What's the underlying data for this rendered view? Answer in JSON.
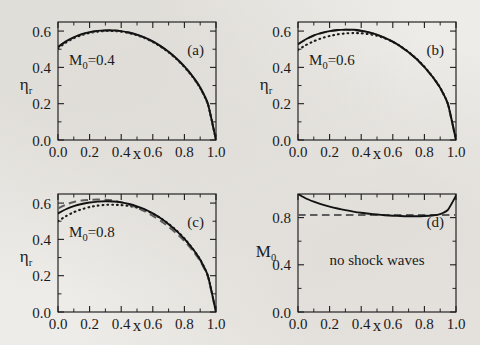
{
  "figure": {
    "background_color": "#eeece8",
    "ink_color": "#121212",
    "dashed_color": "#5d5d5d",
    "layout": "2x2 grid of plots"
  },
  "axis": {
    "x_label": "x",
    "x_ticks": [
      "0.0",
      "0.2",
      "0.4",
      "0.6",
      "0.8",
      "1.0"
    ],
    "x_tick_values": [
      0.0,
      0.2,
      0.4,
      0.6,
      0.8,
      1.0
    ],
    "x_minor_per_interval": 1,
    "eta_label_main": "η",
    "eta_label_sub": "r",
    "eta_ticks": [
      "0.0",
      "0.2",
      "0.4",
      "0.6"
    ],
    "eta_tick_values": [
      0.0,
      0.2,
      0.4,
      0.6
    ],
    "m0_label_main": "M",
    "m0_label_sub": "0",
    "m0_ticks": [
      "0.0",
      "0.4",
      "0.8"
    ],
    "m0_tick_values": [
      0.0,
      0.4,
      0.8
    ]
  },
  "panels": [
    {
      "tag": "(a)",
      "annotation_main": "M",
      "annotation_sub": "0",
      "annotation_rest": "=0.4",
      "y_label_kind": "eta"
    },
    {
      "tag": "(b)",
      "annotation_main": "M",
      "annotation_sub": "0",
      "annotation_rest": "=0.6",
      "y_label_kind": "eta"
    },
    {
      "tag": "(c)",
      "annotation_main": "M",
      "annotation_sub": "0",
      "annotation_rest": "=0.8",
      "y_label_kind": "eta"
    },
    {
      "tag": "(d)",
      "annotation_main": "no shock waves",
      "annotation_sub": "",
      "annotation_rest": "",
      "y_label_kind": "m0"
    }
  ],
  "chart_data": [
    {
      "type": "line",
      "panel": "(a)",
      "title": "",
      "annotation": "M0=0.4",
      "xlabel": "x",
      "ylabel": "η_r",
      "xlim": [
        0.0,
        1.0
      ],
      "ylim": [
        0.0,
        0.65
      ],
      "grid": false,
      "legend": "none",
      "x": [
        0.0,
        0.05,
        0.1,
        0.15,
        0.2,
        0.25,
        0.3,
        0.35,
        0.4,
        0.45,
        0.5,
        0.55,
        0.6,
        0.65,
        0.7,
        0.75,
        0.8,
        0.85,
        0.9,
        0.95,
        1.0
      ],
      "series": [
        {
          "name": "solid",
          "style": "solid",
          "values": [
            0.513,
            0.543,
            0.566,
            0.583,
            0.594,
            0.601,
            0.604,
            0.604,
            0.6,
            0.592,
            0.58,
            0.564,
            0.543,
            0.517,
            0.486,
            0.449,
            0.405,
            0.353,
            0.289,
            0.196,
            0.0
          ]
        },
        {
          "name": "dashed",
          "style": "dashed",
          "values": [
            0.512,
            0.542,
            0.565,
            0.582,
            0.593,
            0.6,
            0.603,
            0.603,
            0.599,
            0.591,
            0.579,
            0.563,
            0.542,
            0.516,
            0.485,
            0.448,
            0.404,
            0.352,
            0.288,
            0.195,
            0.0
          ]
        },
        {
          "name": "dotted",
          "style": "dotted",
          "values": [
            0.505,
            0.537,
            0.561,
            0.578,
            0.59,
            0.597,
            0.6,
            0.6,
            0.597,
            0.589,
            0.577,
            0.561,
            0.54,
            0.514,
            0.483,
            0.446,
            0.402,
            0.35,
            0.287,
            0.194,
            0.0
          ]
        }
      ]
    },
    {
      "type": "line",
      "panel": "(b)",
      "title": "",
      "annotation": "M0=0.6",
      "xlabel": "x",
      "ylabel": "η_r",
      "xlim": [
        0.0,
        1.0
      ],
      "ylim": [
        0.0,
        0.65
      ],
      "grid": false,
      "legend": "none",
      "x": [
        0.0,
        0.05,
        0.1,
        0.15,
        0.2,
        0.25,
        0.3,
        0.35,
        0.4,
        0.45,
        0.5,
        0.55,
        0.6,
        0.65,
        0.7,
        0.75,
        0.8,
        0.85,
        0.9,
        0.95,
        1.0
      ],
      "series": [
        {
          "name": "solid",
          "style": "solid",
          "values": [
            0.528,
            0.555,
            0.576,
            0.59,
            0.6,
            0.606,
            0.608,
            0.607,
            0.602,
            0.593,
            0.58,
            0.563,
            0.542,
            0.515,
            0.483,
            0.446,
            0.402,
            0.35,
            0.287,
            0.195,
            0.0
          ]
        },
        {
          "name": "dashed",
          "style": "dashed",
          "values": [
            0.527,
            0.554,
            0.575,
            0.589,
            0.599,
            0.605,
            0.607,
            0.606,
            0.601,
            0.592,
            0.579,
            0.562,
            0.541,
            0.514,
            0.482,
            0.445,
            0.401,
            0.349,
            0.286,
            0.194,
            0.0
          ]
        },
        {
          "name": "dotted",
          "style": "dotted",
          "values": [
            0.497,
            0.523,
            0.544,
            0.561,
            0.573,
            0.582,
            0.587,
            0.589,
            0.588,
            0.583,
            0.574,
            0.56,
            0.541,
            0.516,
            0.485,
            0.448,
            0.404,
            0.351,
            0.288,
            0.196,
            0.0
          ]
        }
      ]
    },
    {
      "type": "line",
      "panel": "(c)",
      "title": "",
      "annotation": "M0=0.8",
      "xlabel": "x",
      "ylabel": "η_r",
      "xlim": [
        0.0,
        1.0
      ],
      "ylim": [
        0.0,
        0.65
      ],
      "grid": false,
      "legend": "none",
      "x": [
        0.0,
        0.05,
        0.1,
        0.15,
        0.2,
        0.25,
        0.3,
        0.35,
        0.4,
        0.45,
        0.5,
        0.55,
        0.6,
        0.65,
        0.7,
        0.75,
        0.8,
        0.85,
        0.9,
        0.95,
        1.0
      ],
      "series": [
        {
          "name": "solid",
          "style": "solid",
          "values": [
            0.543,
            0.566,
            0.583,
            0.595,
            0.603,
            0.608,
            0.61,
            0.609,
            0.604,
            0.595,
            0.582,
            0.565,
            0.543,
            0.516,
            0.484,
            0.447,
            0.403,
            0.351,
            0.288,
            0.196,
            0.0
          ]
        },
        {
          "name": "dashed",
          "style": "dashed",
          "values": [
            0.57,
            0.592,
            0.606,
            0.614,
            0.618,
            0.62,
            0.619,
            0.614,
            0.605,
            0.592,
            0.575,
            0.554,
            0.53,
            0.502,
            0.47,
            0.433,
            0.391,
            0.341,
            0.281,
            0.192,
            0.0
          ]
        },
        {
          "name": "dotted",
          "style": "dotted",
          "values": [
            0.5,
            0.528,
            0.55,
            0.566,
            0.578,
            0.586,
            0.59,
            0.591,
            0.589,
            0.584,
            0.575,
            0.561,
            0.542,
            0.517,
            0.486,
            0.449,
            0.405,
            0.352,
            0.289,
            0.196,
            0.0
          ]
        }
      ]
    },
    {
      "type": "line",
      "panel": "(d)",
      "title": "",
      "annotation": "no shock waves",
      "xlabel": "x",
      "ylabel": "M_0",
      "xlim": [
        0.0,
        1.0
      ],
      "ylim": [
        0.0,
        1.0
      ],
      "grid": false,
      "legend": "none",
      "x": [
        0.0,
        0.05,
        0.1,
        0.15,
        0.2,
        0.25,
        0.3,
        0.35,
        0.4,
        0.45,
        0.5,
        0.55,
        0.6,
        0.65,
        0.7,
        0.75,
        0.8,
        0.85,
        0.9,
        0.95,
        1.0
      ],
      "series": [
        {
          "name": "solid",
          "style": "solid",
          "values": [
            1.0,
            0.962,
            0.935,
            0.912,
            0.893,
            0.877,
            0.863,
            0.851,
            0.841,
            0.833,
            0.826,
            0.82,
            0.816,
            0.813,
            0.811,
            0.811,
            0.813,
            0.818,
            0.83,
            0.868,
            0.985
          ]
        },
        {
          "name": "dashed-threshold",
          "style": "dashed",
          "values": [
            0.823,
            0.823,
            0.823,
            0.823,
            0.823,
            0.823,
            0.823,
            0.823,
            0.823,
            0.823,
            0.823,
            0.823,
            0.823,
            0.823,
            0.823,
            0.823,
            0.823,
            0.823,
            0.823,
            0.823,
            0.823
          ]
        }
      ]
    }
  ]
}
